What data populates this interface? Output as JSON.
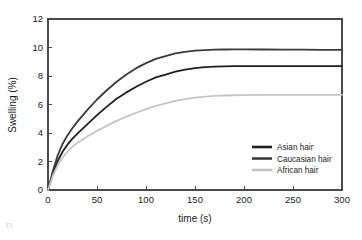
{
  "figure": {
    "caption_fragment": "Fi",
    "background_color": "#ffffff"
  },
  "chart_data": {
    "type": "line",
    "title": "",
    "xlabel": "time (s)",
    "ylabel": "Swelling (%)",
    "xlim": [
      0,
      300
    ],
    "ylim": [
      0,
      12
    ],
    "xticks": [
      0,
      50,
      100,
      150,
      200,
      250,
      300
    ],
    "yticks": [
      0,
      2,
      4,
      6,
      8,
      10,
      12
    ],
    "xtick_labels": [
      "0",
      "50",
      "100",
      "150",
      "200",
      "250",
      "300"
    ],
    "ytick_labels": [
      "0",
      "2",
      "4",
      "6",
      "8",
      "10",
      "12"
    ],
    "grid": false,
    "legend_position": "lower right",
    "x": [
      0,
      5,
      10,
      15,
      20,
      25,
      30,
      40,
      50,
      60,
      70,
      80,
      90,
      100,
      110,
      120,
      130,
      140,
      150,
      160,
      170,
      180,
      190,
      200,
      220,
      240,
      260,
      280,
      300
    ],
    "series": [
      {
        "name": "Asian hair",
        "color": "#1f1f1f",
        "plateau": 8.7,
        "values": [
          0.0,
          1.15,
          2.05,
          2.7,
          3.2,
          3.6,
          3.95,
          4.6,
          5.25,
          5.85,
          6.4,
          6.85,
          7.25,
          7.6,
          7.9,
          8.1,
          8.3,
          8.45,
          8.55,
          8.62,
          8.66,
          8.68,
          8.7,
          8.7,
          8.7,
          8.7,
          8.7,
          8.7,
          8.7
        ]
      },
      {
        "name": "Caucasian hair",
        "color": "#3a3a3a",
        "plateau": 9.85,
        "values": [
          0.0,
          1.35,
          2.45,
          3.25,
          3.85,
          4.35,
          4.8,
          5.6,
          6.35,
          7.0,
          7.6,
          8.1,
          8.55,
          8.9,
          9.2,
          9.4,
          9.58,
          9.7,
          9.78,
          9.82,
          9.85,
          9.86,
          9.87,
          9.87,
          9.86,
          9.85,
          9.85,
          9.84,
          9.83
        ]
      },
      {
        "name": "African hair",
        "color": "#c4c4c4",
        "plateau": 6.65,
        "values": [
          0.0,
          1.0,
          1.75,
          2.3,
          2.7,
          3.05,
          3.3,
          3.75,
          4.15,
          4.5,
          4.85,
          5.15,
          5.42,
          5.68,
          5.9,
          6.08,
          6.25,
          6.38,
          6.48,
          6.55,
          6.6,
          6.63,
          6.65,
          6.66,
          6.67,
          6.68,
          6.68,
          6.68,
          6.67
        ]
      }
    ],
    "legend_entries": [
      {
        "label": "Asian hair",
        "color": "#1f1f1f"
      },
      {
        "label": "Caucasian hair",
        "color": "#3a3a3a"
      },
      {
        "label": "African hair",
        "color": "#c4c4c4"
      }
    ]
  }
}
